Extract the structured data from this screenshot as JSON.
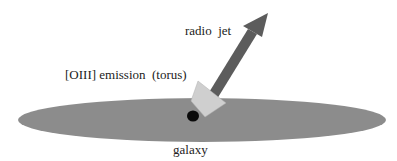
{
  "diagram": {
    "labels": {
      "radio_jet": "radio  jet",
      "oiii_emission": "[OIII] emission  (torus)",
      "galaxy": "galaxy"
    },
    "colors": {
      "background": "#ffffff",
      "galaxy_disk": "#8c8c8c",
      "jet_arrow": "#5c5c5c",
      "torus_cone": "#cfcfcf",
      "nucleus": "#0a0a0a",
      "text": "#222222"
    }
  }
}
